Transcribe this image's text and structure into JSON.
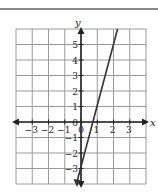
{
  "chart_data": {
    "type": "line",
    "title": "",
    "xlabel": "x",
    "ylabel": "y",
    "xlim": [
      -4,
      4
    ],
    "ylim": [
      -4,
      6
    ],
    "grid": true,
    "x_ticks": [
      "-3",
      "-2",
      "-1",
      "0",
      "1",
      "2",
      "3"
    ],
    "y_ticks": [
      "-3",
      "-2",
      "-1",
      "1",
      "2",
      "3",
      "4",
      "5"
    ],
    "series": [
      {
        "name": "y = 4x - 3",
        "equation": "y = 4x - 3",
        "slope": 4,
        "intercept": -3,
        "x": [
          -0.25,
          0,
          0.75,
          1,
          2,
          2.25
        ],
        "y": [
          -4,
          -3,
          0,
          1,
          5,
          6
        ],
        "color": "#333333"
      }
    ]
  },
  "colors": {
    "grid": "#9a9a9a",
    "axis": "#222222",
    "line": "#333333",
    "rule": "#8a8a8a"
  }
}
